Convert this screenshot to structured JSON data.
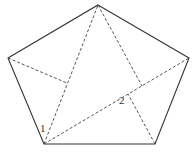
{
  "diagram": {
    "type": "geometry",
    "shape": "pentagon",
    "vertices": {
      "top": [
        98,
        5
      ],
      "right": [
        189,
        58
      ],
      "bottom_right": [
        155,
        144
      ],
      "bottom_left": [
        44,
        144
      ],
      "left": [
        8,
        58
      ]
    },
    "dashed_segments": [
      {
        "from": "bottom_left",
        "to": "top"
      },
      {
        "from": "bottom_left",
        "to": "right"
      },
      {
        "from": "left",
        "to_point": [
          67,
          83
        ]
      },
      {
        "from": "top",
        "to_point": [
          142,
          86
        ]
      },
      {
        "from": "bottom_right",
        "to_point": [
          128,
          94
        ]
      }
    ],
    "labels": [
      {
        "text": "1",
        "position": [
          40,
          132
        ]
      },
      {
        "text": "2",
        "position": [
          119,
          104
        ]
      }
    ],
    "colors": {
      "line": "#333333",
      "background": "#ffffff"
    }
  }
}
